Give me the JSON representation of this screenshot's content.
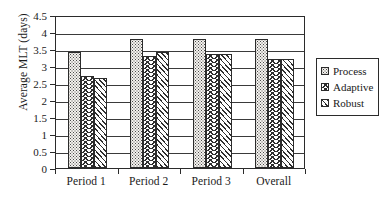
{
  "chart_data": {
    "type": "bar",
    "title": "",
    "xlabel": "",
    "ylabel": "Average MLT (days)",
    "categories": [
      "Period 1",
      "Period 2",
      "Period 3",
      "Overall"
    ],
    "series": [
      {
        "name": "Process",
        "values": [
          3.4,
          3.8,
          3.8,
          3.8
        ],
        "pattern": "dots"
      },
      {
        "name": "Adaptive",
        "values": [
          2.7,
          3.3,
          3.35,
          3.2
        ],
        "pattern": "chevron"
      },
      {
        "name": "Robust",
        "values": [
          2.65,
          3.4,
          3.35,
          3.2
        ],
        "pattern": "hatch"
      }
    ],
    "ylim": [
      0,
      4.5
    ],
    "ytick_step": 0.5,
    "yticks": [
      "0",
      "0.5",
      "1",
      "1.5",
      "2",
      "2.5",
      "3",
      "3.5",
      "4",
      "4.5"
    ],
    "grid": true,
    "grid_axis": "y",
    "legend_position": "right-outside",
    "legend_border": true,
    "colors": {
      "axis": "#2b2b2b",
      "grid": "#3a3a3a",
      "pattern_ink": "#2f2f2f",
      "background": "#ffffff"
    }
  }
}
